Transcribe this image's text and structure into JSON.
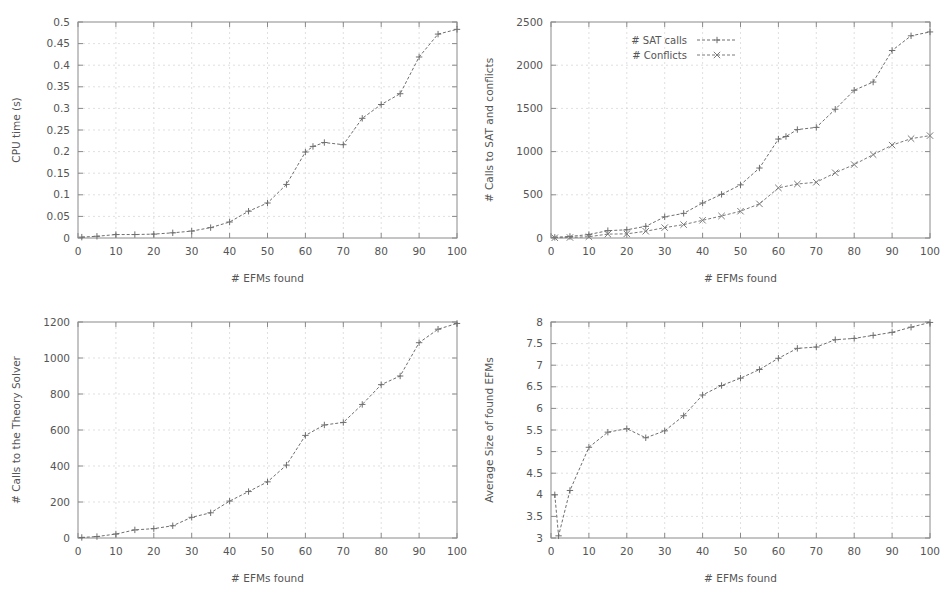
{
  "figure": {
    "background": "#ffffff",
    "ink_color": "#555555",
    "grid_color": "#d2d2d2",
    "frame_color": "#8a8a8a",
    "panel_count": 4
  },
  "chart_data": [
    {
      "id": "cpu-time",
      "position": "top-left",
      "type": "line",
      "title": "",
      "xlabel": "# EFMs found",
      "ylabel": "CPU time (s)",
      "xlim": [
        0,
        100
      ],
      "ylim": [
        0,
        0.5
      ],
      "xticks": [
        0,
        10,
        20,
        30,
        40,
        50,
        60,
        70,
        80,
        90,
        100
      ],
      "xtick_labels": [
        "0",
        "10",
        "20",
        "30",
        "40",
        "50",
        "60",
        "70",
        "80",
        "90",
        "100"
      ],
      "yticks": [
        0,
        0.05,
        0.1,
        0.15,
        0.2,
        0.25,
        0.3,
        0.35,
        0.4,
        0.45,
        0.5
      ],
      "ytick_labels": [
        "0",
        "0.05",
        "0.1",
        "0.15",
        "0.2",
        "0.25",
        "0.3",
        "0.35",
        "0.4",
        "0.45",
        "0.5"
      ],
      "grid": true,
      "legend": null,
      "series": [
        {
          "name": "CPU time",
          "color": "#6f6f6f",
          "marker": "plus",
          "dash": "3 2",
          "x": [
            1,
            5,
            10,
            15,
            20,
            25,
            30,
            35,
            40,
            45,
            50,
            55,
            60,
            62,
            65,
            70,
            75,
            80,
            85,
            90,
            95,
            100
          ],
          "y": [
            0.002,
            0.004,
            0.008,
            0.008,
            0.009,
            0.012,
            0.016,
            0.024,
            0.037,
            0.062,
            0.081,
            0.124,
            0.199,
            0.212,
            0.221,
            0.216,
            0.277,
            0.309,
            0.334,
            0.419,
            0.472,
            0.483
          ]
        }
      ]
    },
    {
      "id": "sat-calls-conflicts",
      "position": "top-right",
      "type": "line",
      "title": "",
      "xlabel": "# EFMs found",
      "ylabel": "# Calls to SAT and conflicts",
      "xlim": [
        0,
        100
      ],
      "ylim": [
        0,
        2500
      ],
      "xticks": [
        0,
        10,
        20,
        30,
        40,
        50,
        60,
        70,
        80,
        90,
        100
      ],
      "xtick_labels": [
        "0",
        "10",
        "20",
        "30",
        "40",
        "50",
        "60",
        "70",
        "80",
        "90",
        "100"
      ],
      "yticks": [
        0,
        500,
        1000,
        1500,
        2000,
        2500
      ],
      "ytick_labels": [
        "0",
        "500",
        "1000",
        "1500",
        "2000",
        "2500"
      ],
      "grid": true,
      "legend": {
        "position": "top-left-inside",
        "entries": [
          "# SAT calls",
          "# Conflicts"
        ]
      },
      "series": [
        {
          "name": "# SAT calls",
          "color": "#6f6f6f",
          "marker": "plus",
          "dash": "3 2",
          "x": [
            1,
            5,
            10,
            15,
            20,
            25,
            30,
            35,
            40,
            45,
            50,
            55,
            60,
            62,
            65,
            70,
            75,
            80,
            85,
            90,
            95,
            100
          ],
          "y": [
            8,
            18,
            40,
            85,
            95,
            135,
            245,
            285,
            405,
            505,
            615,
            810,
            1145,
            1175,
            1255,
            1280,
            1490,
            1710,
            1805,
            2170,
            2340,
            2385
          ]
        },
        {
          "name": "# Conflicts",
          "color": "#7a7a7a",
          "marker": "cross",
          "dash": "3 2",
          "x": [
            1,
            5,
            10,
            15,
            20,
            25,
            30,
            35,
            40,
            45,
            50,
            55,
            60,
            65,
            70,
            75,
            80,
            85,
            90,
            95,
            100
          ],
          "y": [
            3,
            6,
            15,
            45,
            48,
            78,
            120,
            155,
            205,
            255,
            310,
            395,
            580,
            625,
            645,
            755,
            850,
            965,
            1075,
            1150,
            1185
          ]
        }
      ]
    },
    {
      "id": "theory-solver-calls",
      "position": "bottom-left",
      "type": "line",
      "title": "",
      "xlabel": "# EFMs found",
      "ylabel": "# Calls to the Theory Solver",
      "xlim": [
        0,
        100
      ],
      "ylim": [
        0,
        1200
      ],
      "xticks": [
        0,
        10,
        20,
        30,
        40,
        50,
        60,
        70,
        80,
        90,
        100
      ],
      "xtick_labels": [
        "0",
        "10",
        "20",
        "30",
        "40",
        "50",
        "60",
        "70",
        "80",
        "90",
        "100"
      ],
      "yticks": [
        0,
        200,
        400,
        600,
        800,
        1000,
        1200
      ],
      "ytick_labels": [
        "0",
        "200",
        "400",
        "600",
        "800",
        "1000",
        "1200"
      ],
      "grid": true,
      "legend": null,
      "series": [
        {
          "name": "# Calls to the Theory Solver",
          "color": "#6f6f6f",
          "marker": "plus",
          "dash": "3 2",
          "x": [
            1,
            5,
            10,
            15,
            20,
            25,
            30,
            35,
            40,
            45,
            50,
            55,
            60,
            65,
            70,
            75,
            80,
            85,
            90,
            95,
            100
          ],
          "y": [
            3,
            8,
            22,
            45,
            52,
            68,
            115,
            140,
            205,
            258,
            312,
            405,
            570,
            628,
            642,
            742,
            852,
            900,
            1085,
            1160,
            1192
          ]
        }
      ]
    },
    {
      "id": "average-efm-size",
      "position": "bottom-right",
      "type": "line",
      "title": "",
      "xlabel": "# EFMs found",
      "ylabel": "Average Size of found EFMs",
      "xlim": [
        0,
        100
      ],
      "ylim": [
        3,
        8
      ],
      "xticks": [
        0,
        10,
        20,
        30,
        40,
        50,
        60,
        70,
        80,
        90,
        100
      ],
      "xtick_labels": [
        "0",
        "10",
        "20",
        "30",
        "40",
        "50",
        "60",
        "70",
        "80",
        "90",
        "100"
      ],
      "yticks": [
        3,
        3.5,
        4,
        4.5,
        5,
        5.5,
        6,
        6.5,
        7,
        7.5,
        8
      ],
      "ytick_labels": [
        "3",
        "3.5",
        "4",
        "4.5",
        "5",
        "5.5",
        "6",
        "6.5",
        "7",
        "7.5",
        "8"
      ],
      "grid": true,
      "legend": null,
      "series": [
        {
          "name": "Average Size of found EFMs",
          "color": "#6f6f6f",
          "marker": "plus",
          "dash": "3 2",
          "x": [
            1,
            2,
            5,
            10,
            15,
            20,
            25,
            30,
            35,
            40,
            45,
            50,
            55,
            60,
            65,
            70,
            75,
            80,
            85,
            90,
            95,
            100
          ],
          "y": [
            4.0,
            3.05,
            4.1,
            5.1,
            5.45,
            5.53,
            5.32,
            5.48,
            5.83,
            6.31,
            6.53,
            6.7,
            6.9,
            7.16,
            7.39,
            7.42,
            7.59,
            7.62,
            7.69,
            7.76,
            7.88,
            7.99
          ]
        }
      ]
    }
  ]
}
